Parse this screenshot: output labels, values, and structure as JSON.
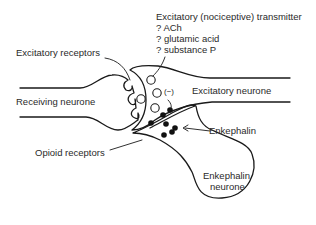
{
  "diagram": {
    "type": "synapse-schematic",
    "labels": {
      "transmitter_title": "Excitatory (nociceptive) transmitter",
      "transmitter_candidates": [
        "? ACh",
        "? glutamic acid",
        "? substance P"
      ],
      "excitatory_receptors": "Excitatory receptors",
      "receiving_neurone": "Receiving neurone",
      "excitatory_neurone": "Excitatory neurone",
      "inhibition_sign": "(−)",
      "enkephalin": "Enkephalin",
      "opioid_receptors": "Opioid receptors",
      "enkephalin_neurone_line1": "Enkephalin",
      "enkephalin_neurone_line2": "neurone"
    },
    "colors": {
      "line": "#1a1a1a",
      "text": "#2a2a2a",
      "background": "#ffffff"
    }
  }
}
